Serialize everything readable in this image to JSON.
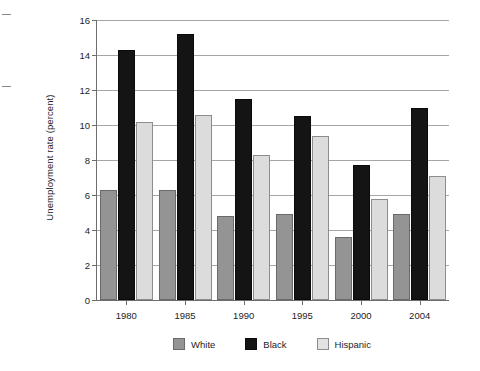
{
  "chart_data": {
    "type": "bar",
    "title": "",
    "xlabel": "",
    "ylabel": "Unemployment rate (percent)",
    "categories": [
      "1980",
      "1985",
      "1990",
      "1995",
      "2000",
      "2004"
    ],
    "series": [
      {
        "name": "White",
        "color": "#949494",
        "values": [
          6.3,
          6.3,
          4.8,
          4.9,
          3.6,
          4.9
        ]
      },
      {
        "name": "Black",
        "color": "#141414",
        "values": [
          14.3,
          15.2,
          11.5,
          10.5,
          7.7,
          11.0
        ]
      },
      {
        "name": "Hispanic",
        "color": "#dcdcdc",
        "values": [
          10.2,
          10.6,
          8.3,
          9.4,
          5.8,
          7.1
        ]
      }
    ],
    "ylim": [
      0,
      16
    ],
    "yticks": [
      0,
      2,
      4,
      6,
      8,
      10,
      12,
      14,
      16
    ],
    "ytick_labels": [
      "0",
      "2",
      "4",
      "6",
      "8",
      "10",
      "12",
      "14",
      "16"
    ],
    "grid": true,
    "legend_position": "bottom",
    "legend": [
      "White",
      "Black",
      "Hispanic"
    ]
  }
}
